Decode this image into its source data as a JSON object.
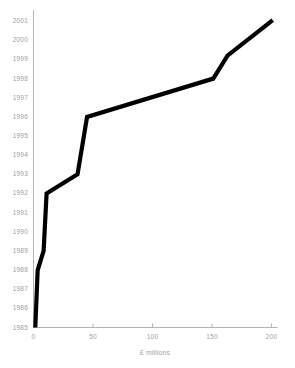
{
  "chart_data": {
    "type": "line",
    "title": "",
    "xlabel": "£ millions",
    "ylabel": "",
    "xlim": [
      0,
      205
    ],
    "ylim": [
      1985,
      2001.4
    ],
    "grid": false,
    "legend": null,
    "x_ticks": [
      "0",
      "50",
      "100",
      "150",
      "200"
    ],
    "x_tick_values": [
      0,
      50,
      100,
      150,
      200
    ],
    "y_ticks": [
      "1985",
      "1986",
      "1987",
      "1988",
      "1989",
      "1990",
      "1991",
      "1992",
      "1993",
      "1994",
      "1995",
      "1996",
      "1997",
      "1998",
      "1999",
      "2000",
      "2001"
    ],
    "y_tick_values": [
      1985,
      1986,
      1987,
      1988,
      1989,
      1990,
      1991,
      1992,
      1993,
      1994,
      1995,
      1996,
      1997,
      1998,
      1999,
      2000,
      2001
    ],
    "series": [
      {
        "name": "Cumulative spend",
        "color": "#000000",
        "line_width": 4.2,
        "x": [
          1.5,
          3.5,
          8.5,
          11.0,
          37.0,
          45.0,
          151.0,
          163.0,
          201.0
        ],
        "y": [
          1985.0,
          1988.0,
          1989.0,
          1992.0,
          1993.0,
          1996.0,
          1998.0,
          1999.2,
          2001.05
        ]
      }
    ],
    "axis_color": "#b4b4b4",
    "text_color": "#a2a2a2",
    "background": "#ffffff"
  },
  "axes": {
    "y_axis_name": "year-axis",
    "x_axis_name": "millions-axis"
  }
}
